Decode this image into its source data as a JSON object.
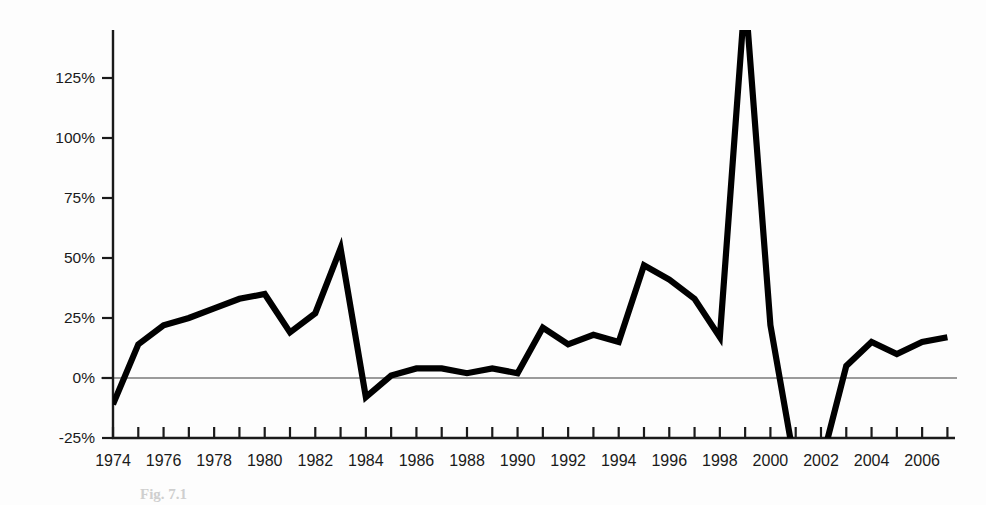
{
  "figure": {
    "background_color": "#fdfdfd",
    "line_color": "#000000",
    "axis_color": "#1a1a1a",
    "caption": "Fig. 7.1"
  },
  "chart_data": {
    "type": "line",
    "title": "",
    "subtitle": "",
    "xlabel": "",
    "ylabel": "",
    "grid": false,
    "legend_position": "none",
    "xlim": [
      1973.5,
      2007.3
    ],
    "ylim": [
      -25,
      145
    ],
    "ytick_labels": [
      "125%",
      "100%",
      "75%",
      "50%",
      "25%",
      "0%",
      "-25%"
    ],
    "ytick_values": [
      125,
      100,
      75,
      50,
      25,
      0,
      -25
    ],
    "xtick_labels": [
      "1974",
      "1976",
      "1978",
      "1980",
      "1982",
      "1984",
      "1986",
      "1988",
      "1990",
      "1992",
      "1994",
      "1996",
      "1998",
      "2000",
      "2002",
      "2004",
      "2006"
    ],
    "xtick_label_values": [
      1974,
      1976,
      1978,
      1980,
      1982,
      1984,
      1986,
      1988,
      1990,
      1992,
      1994,
      1996,
      1998,
      2000,
      2002,
      2004,
      2006
    ],
    "xtick_minor_values": [
      1974,
      1975,
      1976,
      1977,
      1978,
      1979,
      1980,
      1981,
      1982,
      1983,
      1984,
      1985,
      1986,
      1987,
      1988,
      1989,
      1990,
      1991,
      1992,
      1993,
      1994,
      1995,
      1996,
      1997,
      1998,
      1999,
      2000,
      2001,
      2002,
      2003,
      2004,
      2005,
      2006,
      2007
    ],
    "zero_reference_line": 0,
    "clipped_at_top": true,
    "clipped_at_bottom": true,
    "series": [
      {
        "name": "Annual change",
        "x": [
          1974,
          1975,
          1976,
          1977,
          1978,
          1979,
          1980,
          1981,
          1982,
          1983,
          1984,
          1985,
          1986,
          1987,
          1988,
          1989,
          1990,
          1991,
          1992,
          1993,
          1994,
          1995,
          1996,
          1997,
          1998,
          1999,
          2000,
          2001,
          2002,
          2003,
          2004,
          2005,
          2006,
          2007
        ],
        "values": [
          -11,
          14,
          22,
          25,
          29,
          33,
          35,
          19,
          27,
          54,
          -8,
          1,
          4,
          4,
          2,
          4,
          2,
          21,
          14,
          18,
          15,
          47,
          41,
          33,
          17,
          160,
          22,
          -38,
          -36,
          5,
          15,
          10,
          15,
          17
        ]
      }
    ]
  }
}
